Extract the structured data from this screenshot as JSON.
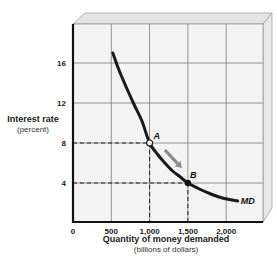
{
  "chart_data": {
    "type": "line",
    "title": "",
    "ylabel": "Interest rate",
    "ylabel_sub": "(percent)",
    "xlabel": "Quantity of money demanded",
    "xlabel_sub": "(billions of dollars)",
    "xlim": [
      0,
      2500
    ],
    "ylim": [
      0,
      20
    ],
    "x_ticks": [
      0,
      500,
      1000,
      1500,
      2000
    ],
    "x_tick_labels": [
      "0",
      "500",
      "1,000",
      "1,500",
      "2,000"
    ],
    "y_ticks": [
      4,
      8,
      12,
      16
    ],
    "y_tick_labels": [
      "4",
      "8",
      "12",
      "16"
    ],
    "grid": true,
    "series": [
      {
        "name": "MD",
        "x": [
          520,
          600,
          700,
          800,
          900,
          1000,
          1100,
          1200,
          1300,
          1400,
          1500,
          1650,
          1800,
          1950,
          2150
        ],
        "y": [
          17,
          15.3,
          13.5,
          11.8,
          10.2,
          8,
          6.9,
          6.0,
          5.2,
          4.6,
          4,
          3.4,
          2.9,
          2.5,
          2.2
        ]
      }
    ],
    "points": [
      {
        "label": "A",
        "x": 1000,
        "y": 8,
        "style": "hollow"
      },
      {
        "label": "B",
        "x": 1500,
        "y": 4,
        "style": "filled"
      }
    ],
    "reference_lines": [
      {
        "from": [
          0,
          8
        ],
        "to": [
          1000,
          8
        ],
        "style": "dashed"
      },
      {
        "from": [
          1000,
          8
        ],
        "to": [
          1000,
          0
        ],
        "style": "dashed"
      },
      {
        "from": [
          0,
          4
        ],
        "to": [
          1500,
          4
        ],
        "style": "dashed"
      },
      {
        "from": [
          1500,
          4
        ],
        "to": [
          1500,
          0
        ],
        "style": "dashed"
      }
    ],
    "annotations": [
      {
        "type": "arrow",
        "from": [
          1200,
          7.3
        ],
        "to": [
          1420,
          5.5
        ],
        "color": "#8a8a8a",
        "meaning": "movement along MD from A to B"
      }
    ],
    "curve_label": "MD"
  },
  "colors": {
    "curve": "#1a1a1a",
    "grid": "#7a7a7a",
    "plot_bg": "#f3f3f3",
    "frame": "#e6e6e6",
    "arrow": "#8a8a8a"
  }
}
